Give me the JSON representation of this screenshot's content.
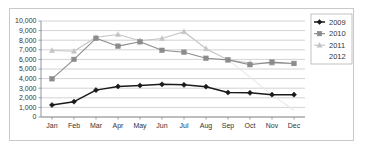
{
  "chart_data": {
    "type": "line",
    "title": "",
    "xlabel": "",
    "ylabel": "",
    "ylim": [
      0,
      10000
    ],
    "ytick_labels": [
      "0",
      "1,000",
      "2,000",
      "3,000",
      "4,000",
      "5,000",
      "6,000",
      "7,000",
      "8,000",
      "9,000",
      "10,000"
    ],
    "ytick_values": [
      0,
      1000,
      2000,
      3000,
      4000,
      5000,
      6000,
      7000,
      8000,
      9000,
      10000
    ],
    "grid": true,
    "legend_position": "right",
    "categories": [
      "Jan",
      "Feb",
      "Mar",
      "Apr",
      "May",
      "Jun",
      "Jul",
      "Aug",
      "Sep",
      "Oct",
      "Nov",
      "Dec"
    ],
    "series": [
      {
        "name": "2009",
        "color": "#1a1a1a",
        "marker": "diamond",
        "values": [
          1250,
          1600,
          2800,
          3180,
          3280,
          3400,
          3350,
          3160,
          2550,
          2520,
          2330,
          2330
        ]
      },
      {
        "name": "2010",
        "color": "#8c8c8c",
        "marker": "square",
        "values": [
          3980,
          6000,
          8200,
          7380,
          7830,
          6950,
          6750,
          6120,
          5950,
          5450,
          5720,
          5580
        ]
      },
      {
        "name": "2011",
        "color": "#c4c4c4",
        "marker": "triangle",
        "values": [
          6930,
          6850,
          8300,
          8600,
          7950,
          8180,
          8880,
          7120,
          5950,
          5620,
          5600,
          5560
        ]
      },
      {
        "name": "2012",
        "color": "#e8e8e8",
        "marker": "none",
        "values": [
          null,
          null,
          null,
          null,
          null,
          null,
          8880,
          7120,
          5950,
          4150,
          2300,
          700
        ]
      }
    ]
  },
  "legend": {
    "entries": [
      {
        "label": "2009"
      },
      {
        "label": "2010"
      },
      {
        "label": "2011"
      },
      {
        "label": "2012"
      }
    ]
  }
}
